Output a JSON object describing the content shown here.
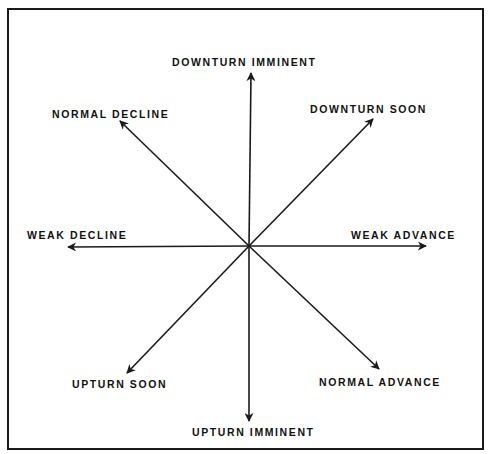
{
  "diagram": {
    "center": [
      249,
      246
    ],
    "stroke_color": "#1a1a1a",
    "arrows": [
      {
        "id": "n",
        "label": "DOWNTURN IMMINENT",
        "tip": [
          251,
          73
        ],
        "label_pos": [
          172,
          57
        ]
      },
      {
        "id": "ne",
        "label": "DOWNTURN SOON",
        "tip": [
          373,
          119
        ],
        "label_pos": [
          310,
          104
        ]
      },
      {
        "id": "e",
        "label": "WEAK ADVANCE",
        "tip": [
          426,
          246
        ],
        "label_pos": [
          351,
          230
        ]
      },
      {
        "id": "se",
        "label": "NORMAL ADVANCE",
        "tip": [
          379,
          369
        ],
        "label_pos": [
          319,
          377
        ]
      },
      {
        "id": "s",
        "label": "UPTURN IMMINENT",
        "tip": [
          249,
          421
        ],
        "label_pos": [
          192,
          427
        ]
      },
      {
        "id": "sw",
        "label": "UPTURN SOON",
        "tip": [
          127,
          373
        ],
        "label_pos": [
          72,
          379
        ]
      },
      {
        "id": "w",
        "label": "WEAK DECLINE",
        "tip": [
          68,
          247
        ],
        "label_pos": [
          27,
          230
        ]
      },
      {
        "id": "nw",
        "label": "NORMAL DECLINE",
        "tip": [
          120,
          121
        ],
        "label_pos": [
          52,
          109
        ]
      }
    ]
  }
}
